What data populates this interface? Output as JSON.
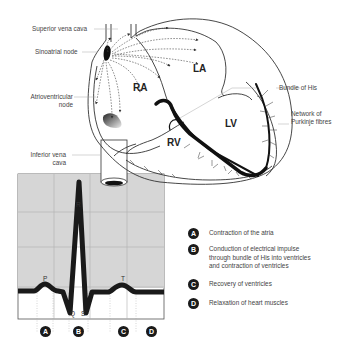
{
  "diagram": {
    "labels": {
      "superior_vena_cava": "Superior vena cava",
      "sinoatrial_node": "Sinoatrial node",
      "atrioventricular_node_line1": "Atrioventricular",
      "atrioventricular_node_line2": "node",
      "inferior_vena_cava_line1": "Inferior vena",
      "inferior_vena_cava_line2": "cava",
      "bundle_of_his": "Bundle of His",
      "purkinje_line1": "Network of",
      "purkinje_line2": "Purkinje fibres"
    },
    "chambers": {
      "ra": "RA",
      "la": "LA",
      "rv": "RV",
      "lv": "LV"
    },
    "ecg": {
      "waves": {
        "p": "P",
        "q": "Q",
        "r": "R",
        "s": "S",
        "t": "T"
      },
      "phase_badges": [
        "A",
        "B",
        "C",
        "D"
      ],
      "colors": {
        "grid_bg": "#d9d9d9",
        "trace": "#1a1a1a",
        "grid_line": "#b0b0b0"
      }
    },
    "legend": [
      {
        "badge": "A",
        "text": "Contraction of the atria"
      },
      {
        "badge": "B",
        "text_lines": [
          "Conduction of electrical impulse",
          "through bundle of His into ventricles",
          "and contraction of ventricles"
        ]
      },
      {
        "badge": "C",
        "text": "Recovery of ventricles"
      },
      {
        "badge": "D",
        "text": "Relaxation of heart muscles"
      }
    ]
  }
}
